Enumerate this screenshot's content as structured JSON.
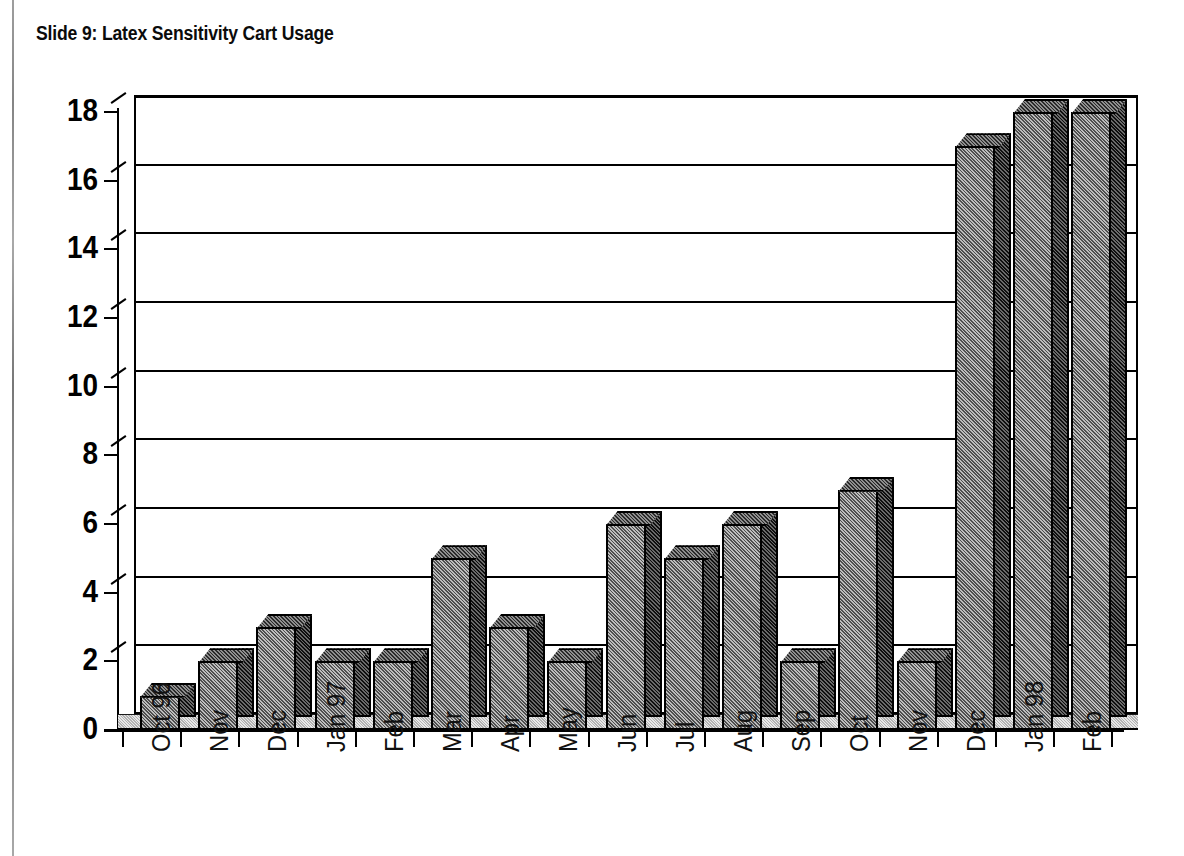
{
  "slide": {
    "title": "Slide 9: Latex Sensitivity Cart Usage"
  },
  "chart_data": {
    "type": "bar",
    "title": "Slide 9: Latex Sensitivity Cart Usage",
    "xlabel": "",
    "ylabel": "",
    "ylim": [
      0,
      18
    ],
    "ytick_step": 2,
    "grid": true,
    "legend": "none",
    "style": "3d-column",
    "categories": [
      "Oct 96",
      "Nov",
      "Dec",
      "Jan 97",
      "Feb",
      "Mar",
      "Apr",
      "May",
      "Jun",
      "Jul",
      "Aug",
      "Sep",
      "Oct",
      "Nov",
      "Dec",
      "Jan 98",
      "Feb"
    ],
    "values": [
      1,
      2,
      3,
      2,
      2,
      5,
      3,
      2,
      6,
      5,
      6,
      2,
      7,
      2,
      17,
      18,
      18
    ],
    "yticks": [
      0,
      2,
      4,
      6,
      8,
      10,
      12,
      14,
      16,
      18
    ],
    "ytick_labels": [
      "0",
      "2",
      "4",
      "6",
      "8",
      "10",
      "12",
      "14",
      "16",
      "18"
    ],
    "colors": {
      "bar_front": "#9a9a9a",
      "bar_side": "#3c3c3c",
      "bar_top": "#6e6e6e",
      "axis": "#000000",
      "grid": "#000000",
      "background": "#ffffff"
    }
  }
}
